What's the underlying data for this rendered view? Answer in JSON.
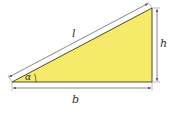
{
  "diagram": {
    "type": "right-triangle",
    "colors": {
      "fill": "#f6ea6a",
      "edge": "#4a4a2a",
      "dimension_line": "#555555",
      "label": "#333333"
    },
    "labels": {
      "hypotenuse": "l",
      "height": "h",
      "base": "b",
      "angle": "α"
    }
  }
}
